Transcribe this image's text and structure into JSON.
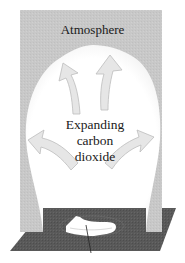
{
  "diagram": {
    "title_label": "Atmosphere",
    "center_label_lines": [
      "Expanding",
      "carbon",
      "dioxide"
    ],
    "arrow_count": 4,
    "arrow_direction": "outward-upward",
    "colors": {
      "atmosphere_gray": "#c9c9c9",
      "bubble_white": "#ffffff",
      "arrow_fill": "#e6e6e6",
      "arrow_stroke": "#bdbdbd",
      "ground_dark": "#5a5a5a",
      "dry_ice_white": "#ffffff",
      "leader_line": "#222222"
    },
    "components": [
      "atmosphere-region",
      "expanding-gas-bubble",
      "expansion-arrows",
      "ground-surface",
      "dry-ice-source",
      "leader-line"
    ]
  }
}
